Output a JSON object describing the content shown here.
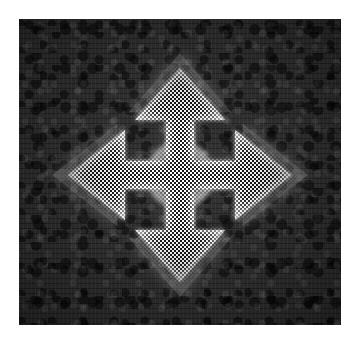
{
  "image": {
    "title": "Four-way move arrow icon",
    "description": "Halftone-printed white four-directional move/drag arrow on a dark mottled square background",
    "canvas_width": 359,
    "canvas_height": 342,
    "page_background": "#ffffff"
  },
  "panel": {
    "name": "dark-textured-square",
    "x": 19,
    "y": 19,
    "width": 322,
    "height": 306,
    "base_color": "#2a2a2a",
    "texture": "mottled-noise",
    "edge_vignette": true
  },
  "icon": {
    "semantic_name": "move-arrow-icon",
    "glyph": "four-directional-arrow",
    "fill_color": "#ffffff",
    "glow_color": "#ffffff",
    "render_style": "halftone-dither",
    "halftone_cell_px": 4,
    "center_x": 180,
    "center_y": 175,
    "tip_top_y": 68,
    "tip_bottom_y": 282,
    "tip_left_x": 68,
    "tip_right_x": 292,
    "shaft_width_px": 28,
    "arrowhead_width_px": 90,
    "arrowhead_length_px": 52,
    "directions": [
      "up",
      "right",
      "down",
      "left"
    ]
  }
}
